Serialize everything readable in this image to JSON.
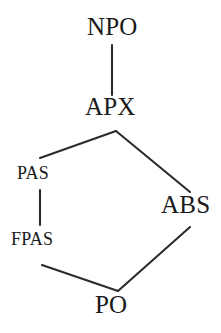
{
  "diagram": {
    "type": "hasse-lattice",
    "background_color": "#ffffff",
    "line_color": "#2b2b2b",
    "text_color": "#1a1a1a",
    "nodes": [
      {
        "id": "npo",
        "label": "NPO",
        "style": "caps",
        "x": 112,
        "y": 29
      },
      {
        "id": "apx",
        "label": "APX",
        "style": "caps",
        "x": 113,
        "y": 109
      },
      {
        "id": "pas",
        "label": "PAS",
        "style": "smallcaps",
        "x": 42,
        "y": 173
      },
      {
        "id": "abs",
        "label": "ABS",
        "style": "caps",
        "x": 189,
        "y": 207
      },
      {
        "id": "fpas",
        "label": "FPAS",
        "style": "smallcaps",
        "x": 42,
        "y": 239
      },
      {
        "id": "po",
        "label": "PO",
        "style": "caps",
        "x": 117,
        "y": 307
      }
    ],
    "edges": [
      {
        "from": "npo",
        "to": "apx",
        "x1": 112,
        "y1": 45,
        "x2": 112,
        "y2": 95
      },
      {
        "from": "apx",
        "to": "pas",
        "x1": 116,
        "y1": 131,
        "x2": 40,
        "y2": 158
      },
      {
        "from": "apx",
        "to": "abs",
        "x1": 116,
        "y1": 131,
        "x2": 190,
        "y2": 192
      },
      {
        "from": "pas",
        "to": "fpas",
        "x1": 40,
        "y1": 190,
        "x2": 40,
        "y2": 225
      },
      {
        "from": "fpas",
        "to": "po",
        "x1": 42,
        "y1": 265,
        "x2": 118,
        "y2": 291
      },
      {
        "from": "po",
        "to": "abs",
        "x1": 118,
        "y1": 291,
        "x2": 190,
        "y2": 227
      }
    ]
  }
}
